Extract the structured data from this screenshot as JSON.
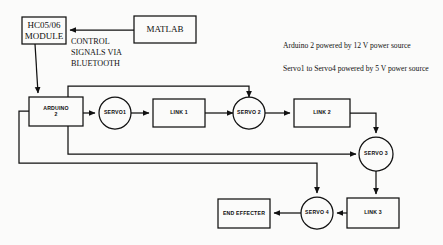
{
  "diagram": {
    "stroke_color": "#111111",
    "background_color": "#fbfbfa",
    "nodes": {
      "matlab": {
        "label": "MATLAB",
        "shape": "rect"
      },
      "hc_module": {
        "label": "HC05/06\nMODULE",
        "shape": "rect"
      },
      "arduino": {
        "label": "ARDUINO\n2",
        "shape": "rect"
      },
      "servo1": {
        "label": "SERVO1",
        "shape": "circle"
      },
      "link1": {
        "label": "LINK 1",
        "shape": "rect"
      },
      "servo2": {
        "label": "SERVO 2",
        "shape": "circle"
      },
      "link2": {
        "label": "LINK 2",
        "shape": "rect"
      },
      "servo3": {
        "label": "SERVO 3",
        "shape": "circle"
      },
      "link3": {
        "label": "LINK 3",
        "shape": "rect"
      },
      "servo4": {
        "label": "SERVO 4",
        "shape": "circle"
      },
      "end_effecter": {
        "label": "END EFFECTER",
        "shape": "rect"
      }
    },
    "annotations": {
      "bluetooth": "CONTROL\nSIGNALS VIA\nBLUETOOTH",
      "power_arduino": "Arduino 2 powered by 12 V power source",
      "power_servos": "Servo1 to Servo4 powered by 5 V power source"
    }
  }
}
